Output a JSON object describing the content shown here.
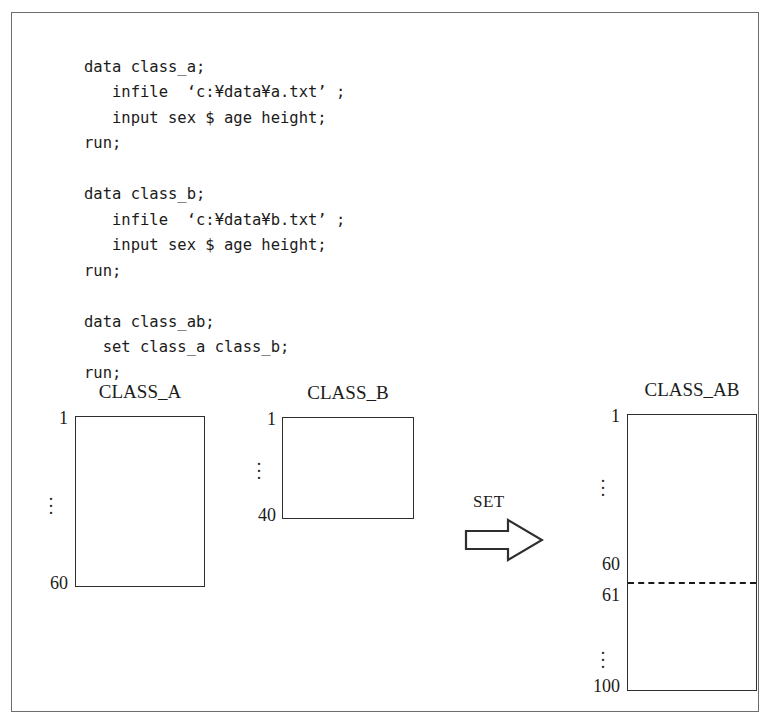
{
  "figure": {
    "code": {
      "lines": [
        "data class_a;",
        "   infile  ‘c:¥data¥a.txt’ ;",
        "   input sex $ age height;",
        "run;",
        "",
        "data class_b;",
        "   infile  ‘c:¥data¥b.txt’ ;",
        "   input sex $ age height;",
        "run;",
        "",
        "data class_ab;",
        "  set class_a class_b;",
        "run;"
      ]
    },
    "datasets": [
      {
        "id": "class_a",
        "title": "CLASS_A",
        "first_row": "1",
        "ellipsis": "⋮",
        "last_row": "60"
      },
      {
        "id": "class_b",
        "title": "CLASS_B",
        "first_row": "1",
        "ellipsis": "⋮",
        "last_row": "40"
      },
      {
        "id": "class_ab",
        "title": "CLASS_AB",
        "first_row": "1",
        "ellipsis_upper": "⋮",
        "split_above": "60",
        "split_below": "61",
        "ellipsis_lower": "⋮",
        "last_row": "100"
      }
    ],
    "operation": {
      "label": "SET",
      "arrow_icon": "right-block-arrow-icon"
    },
    "colors": {
      "ink": "#1b1b1b",
      "box_stroke": "#2e2e2e",
      "frame_stroke": "#6d6d6d",
      "background": "#ffffff"
    }
  }
}
